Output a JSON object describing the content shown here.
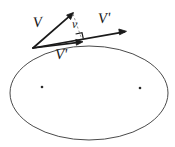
{
  "figure": {
    "background_color": "#ffffff",
    "stroke_color": "#1a1a1a",
    "ellipse_stroke_color": "#4a4a4a",
    "width": 175,
    "height": 147
  },
  "labels": {
    "v_initial": "V",
    "v_delta": "v",
    "v_prime_upper": "V'",
    "v_prime_lower": "V'"
  },
  "ellipse": {
    "name": "orbit-ellipse",
    "center_x": 89,
    "center_y": 93,
    "radius_x": 79,
    "radius_y": 47
  },
  "foci": [
    {
      "name": "focus-left",
      "x": 42,
      "y": 87
    },
    {
      "name": "focus-right",
      "x": 140,
      "y": 88
    }
  ],
  "vectors": [
    {
      "name": "vector-V-initial",
      "label": "V",
      "from_x": 33,
      "from_y": 48,
      "to_x": 73,
      "to_y": 13
    },
    {
      "name": "vector-V-prime-upper",
      "label": "V'",
      "from_x": 33,
      "from_y": 48,
      "to_x": 126,
      "to_y": 32
    },
    {
      "name": "vector-V-prime-lower",
      "label": "V'",
      "from_x": 33,
      "from_y": 48,
      "to_x": 83,
      "to_y": 42
    }
  ],
  "construction": {
    "dashed_line": {
      "name": "delta-v-dashed-line",
      "from_x": 73,
      "from_y": 14,
      "to_x": 81,
      "to_y": 37
    },
    "right_angle_marker": {
      "name": "right-angle-marker",
      "x": 78,
      "y": 34,
      "size": 7
    }
  }
}
